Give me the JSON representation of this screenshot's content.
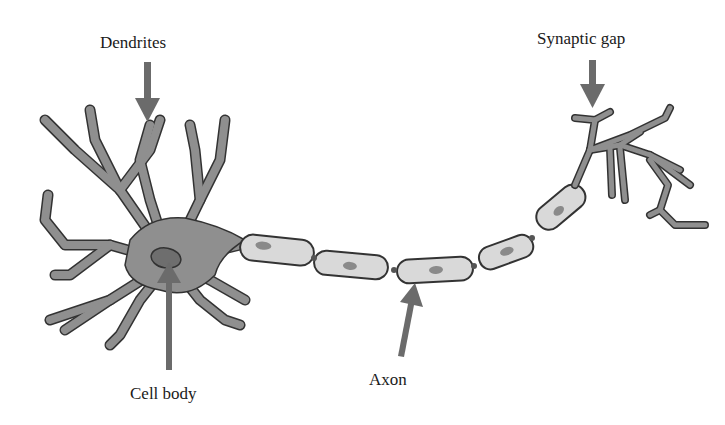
{
  "diagram": {
    "labels": {
      "dendrites": "Dendrites",
      "synaptic_gap": "Synaptic gap",
      "cell_body": "Cell body",
      "axon": "Axon"
    },
    "colors": {
      "neuron_fill": "#8f8f8f",
      "neuron_outline": "#333333",
      "myelin_fill": "#d9d9d9",
      "nucleus_fill": "#6e6e6e",
      "arrow": "#6b6b6b",
      "text": "#1a1a1a",
      "background": "#ffffff"
    },
    "components": [
      {
        "name": "Dendrites",
        "pointer": "down-arrow"
      },
      {
        "name": "Cell body",
        "pointer": "up-arrow"
      },
      {
        "name": "Axon",
        "pointer": "up-arrow",
        "segments": 6
      },
      {
        "name": "Synaptic gap",
        "pointer": "down-arrow"
      }
    ]
  }
}
